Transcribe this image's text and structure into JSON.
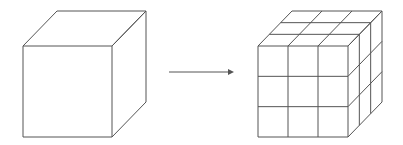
{
  "diagram": {
    "title": "",
    "line_color": "#555555",
    "background": "#ffffff",
    "left_cube": {
      "label": "",
      "front_face": {
        "x": 23,
        "y": 46,
        "w": 89,
        "h": 91
      },
      "depth_offset": {
        "dx": 34,
        "dy": -35
      },
      "subdivisions": 1
    },
    "arrow": {
      "label": "",
      "x1": 169,
      "y1": 72,
      "x2": 234,
      "y2": 72,
      "direction": "right"
    },
    "right_cube": {
      "label": "",
      "front_face": {
        "x": 258,
        "y": 46,
        "w": 90,
        "h": 91
      },
      "depth_offset": {
        "dx": 34,
        "dy": -35
      },
      "subdivisions": 3
    }
  }
}
